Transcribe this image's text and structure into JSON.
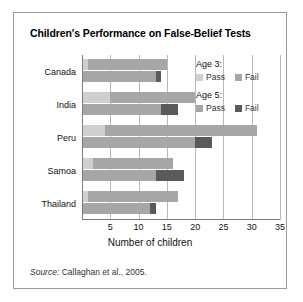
{
  "figure": {
    "title": "Children's Performance on False-Belief Tests",
    "source_prefix": "Source:",
    "source_text": " Callaghan et al., 2005."
  },
  "legend": {
    "groups": [
      {
        "title": "Age 3:",
        "pass_label": "Pass",
        "fail_label": "Fail",
        "pass_color": "#cfcfcf",
        "fail_color": "#a6a6a6"
      },
      {
        "title": "Age 5:",
        "pass_label": "Pass",
        "fail_label": "Fail",
        "pass_color": "#a6a6a6",
        "fail_color": "#5a5a5a"
      }
    ]
  },
  "chart_data": {
    "type": "bar",
    "orientation": "horizontal",
    "stacked": true,
    "title": "Children's Performance on False-Belief Tests",
    "xlabel": "Number of children",
    "ylabel": "",
    "xlim": [
      0,
      35
    ],
    "xticks": [
      5,
      10,
      15,
      20,
      25,
      30,
      35
    ],
    "grid": "vertical",
    "legend_position": "inside-top-right",
    "categories": [
      "Canada",
      "India",
      "Peru",
      "Samoa",
      "Thailand"
    ],
    "series": [
      {
        "name": "Age 3: Pass",
        "color": "#cfcfcf",
        "values": [
          1,
          5,
          4,
          2,
          1
        ]
      },
      {
        "name": "Age 3: Fail",
        "color": "#a6a6a6",
        "values": [
          14,
          15,
          27,
          14,
          16
        ]
      },
      {
        "name": "Age 5: Pass",
        "color": "#a6a6a6",
        "values": [
          13,
          14,
          20,
          13,
          12
        ]
      },
      {
        "name": "Age 5: Fail",
        "color": "#5a5a5a",
        "values": [
          1,
          3,
          3,
          5,
          1
        ]
      }
    ],
    "totals": {
      "age3": [
        15,
        20,
        31,
        16,
        17
      ],
      "age5": [
        14,
        17,
        23,
        18,
        13
      ]
    }
  }
}
